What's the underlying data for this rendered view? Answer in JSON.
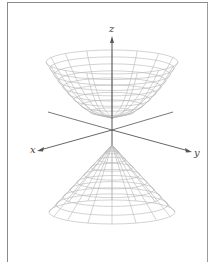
{
  "figure": {
    "axes": {
      "z_label": "z",
      "x_label": "x",
      "y_label": "y"
    },
    "colors": {
      "frame": "#8a8a8a",
      "mesh": "#b5b5b5",
      "axis": "#555555",
      "background": "#ffffff"
    },
    "geometry": {
      "origin": [
        112,
        130
      ],
      "upper_nappe": {
        "rim_center": [
          112,
          62
        ],
        "rx": 66,
        "ry": 12,
        "vertex": [
          112,
          118
        ],
        "rings": 9,
        "meridians": 16
      },
      "lower_nappe": {
        "apex": [
          112,
          145
        ],
        "base_center": [
          112,
          212
        ],
        "rx": 63,
        "ry": 12,
        "rings": 9,
        "meridians": 16
      }
    }
  }
}
